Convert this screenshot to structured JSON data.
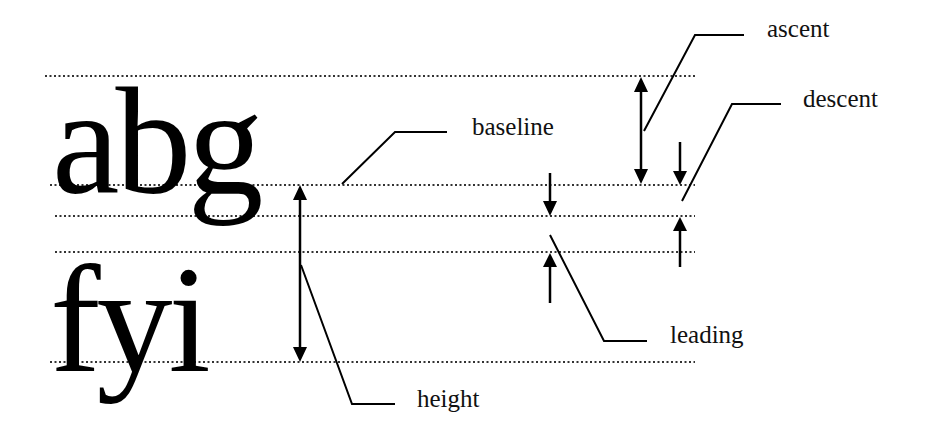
{
  "diagram": {
    "samples": {
      "line1": "abg",
      "line2": "fyi"
    },
    "labels": {
      "ascent": "ascent",
      "descent": "descent",
      "baseline": "baseline",
      "leading": "leading",
      "height": "height"
    },
    "guides": [
      {
        "name": "ascent-line",
        "y": 76
      },
      {
        "name": "baseline-1",
        "y": 185
      },
      {
        "name": "descent-line",
        "y": 216
      },
      {
        "name": "ascent-line-2",
        "y": 252
      },
      {
        "name": "baseline-2",
        "y": 362
      }
    ],
    "colors": {
      "ink": "#000000",
      "background": "#ffffff",
      "guide": "#333333"
    }
  }
}
